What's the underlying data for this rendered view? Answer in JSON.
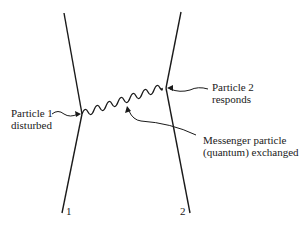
{
  "diagram": {
    "type": "feynman-style exchange diagram",
    "particles": [
      {
        "id": "particle-1",
        "number_label": "1"
      },
      {
        "id": "particle-2",
        "number_label": "2"
      }
    ],
    "labels": {
      "particle1": {
        "line1": "Particle 1",
        "line2": "disturbed"
      },
      "particle2": {
        "line1": "Particle 2",
        "line2": "responds"
      },
      "messenger": {
        "line1": "Messenger particle",
        "line2": "(quantum) exchanged"
      }
    },
    "line_color": "#1a1a1a"
  }
}
